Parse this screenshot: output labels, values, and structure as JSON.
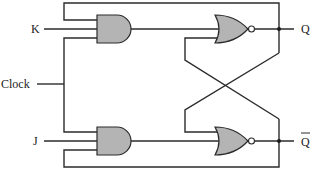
{
  "diagram": {
    "inputs": {
      "k": "K",
      "clock": "Clock",
      "j": "J"
    },
    "outputs": {
      "q": "Q",
      "q_bar": "Q"
    },
    "gates": [
      {
        "id": "and-upper",
        "type": "AND",
        "inputs": [
          "Q (feedback)",
          "K",
          "Clock"
        ],
        "output": "nor-upper"
      },
      {
        "id": "and-lower",
        "type": "AND",
        "inputs": [
          "Clock",
          "J",
          "Q-bar (feedback)"
        ],
        "output": "nor-lower"
      },
      {
        "id": "nor-upper",
        "type": "NOR",
        "inputs": [
          "and-upper",
          "nor-lower"
        ],
        "output": "Q"
      },
      {
        "id": "nor-lower",
        "type": "NOR",
        "inputs": [
          "nor-upper",
          "and-lower"
        ],
        "output": "Q-bar"
      }
    ],
    "colors": {
      "gate_fill": "#b4b4b4",
      "wire": "#2b2b2b",
      "background": "#ffffff"
    }
  }
}
